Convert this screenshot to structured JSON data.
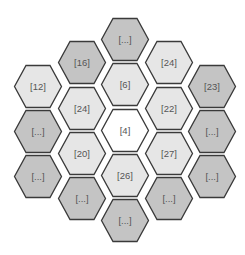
{
  "diagram": {
    "type": "hexagonal-grid",
    "colors": {
      "center": "#ffffff",
      "light": "#e6e6e6",
      "dark": "#c4c4c4",
      "stroke": "#3a3a3a"
    },
    "cells": [
      {
        "label": "[...]",
        "col": 3,
        "cx": 125,
        "cy": 39,
        "shade": "dark"
      },
      {
        "label": "[16]",
        "col": 2,
        "cx": 82,
        "cy": 62,
        "shade": "dark"
      },
      {
        "label": "[24]",
        "col": 4,
        "cx": 169,
        "cy": 62,
        "shade": "light"
      },
      {
        "label": "[12]",
        "col": 1,
        "cx": 38,
        "cy": 86,
        "shade": "light"
      },
      {
        "label": "[6]",
        "col": 3,
        "cx": 125,
        "cy": 84,
        "shade": "light"
      },
      {
        "label": "[23]",
        "col": 5,
        "cx": 212,
        "cy": 86,
        "shade": "dark"
      },
      {
        "label": "[24]",
        "col": 2,
        "cx": 82,
        "cy": 108,
        "shade": "light"
      },
      {
        "label": "[22]",
        "col": 4,
        "cx": 169,
        "cy": 108,
        "shade": "light"
      },
      {
        "label": "[...]",
        "col": 1,
        "cx": 38,
        "cy": 131,
        "shade": "dark"
      },
      {
        "label": "[4]",
        "col": 3,
        "cx": 125,
        "cy": 130,
        "shade": "center"
      },
      {
        "label": "[...]",
        "col": 5,
        "cx": 212,
        "cy": 131,
        "shade": "dark"
      },
      {
        "label": "[20]",
        "col": 2,
        "cx": 82,
        "cy": 153,
        "shade": "light"
      },
      {
        "label": "[27]",
        "col": 4,
        "cx": 169,
        "cy": 153,
        "shade": "light"
      },
      {
        "label": "[...]",
        "col": 1,
        "cx": 38,
        "cy": 176,
        "shade": "dark"
      },
      {
        "label": "[26]",
        "col": 3,
        "cx": 125,
        "cy": 175,
        "shade": "light"
      },
      {
        "label": "[...]",
        "col": 5,
        "cx": 212,
        "cy": 176,
        "shade": "dark"
      },
      {
        "label": "[...]",
        "col": 2,
        "cx": 82,
        "cy": 198,
        "shade": "dark"
      },
      {
        "label": "[...]",
        "col": 4,
        "cx": 169,
        "cy": 198,
        "shade": "dark"
      },
      {
        "label": "[...]",
        "col": 3,
        "cx": 125,
        "cy": 220,
        "shade": "dark"
      }
    ]
  }
}
